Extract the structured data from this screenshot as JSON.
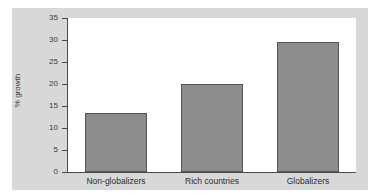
{
  "chart_data": {
    "type": "bar",
    "title": "",
    "xlabel": "",
    "ylabel": "% growth",
    "categories": [
      "Non-globalizers",
      "Rich countries",
      "Globalizers"
    ],
    "values": [
      13.5,
      20.0,
      29.5
    ],
    "ylim": [
      0,
      35
    ],
    "yticks": [
      0,
      5,
      10,
      15,
      20,
      25,
      30,
      35
    ],
    "ytick_labels": [
      "0",
      "5",
      "10",
      "15",
      "20",
      "25",
      "30",
      "35"
    ],
    "grid": false,
    "legend": null,
    "series": [
      {
        "name": "% growth",
        "values": [
          13.5,
          20.0,
          29.5
        ],
        "color": "#8c8c8c",
        "edge_color": "#555555"
      }
    ]
  },
  "figure": {
    "panel_color": "#d8d8d8",
    "plot_background": "#ffffff",
    "axis_color": "#4a4a4a",
    "text_color": "#2c2c2c"
  }
}
